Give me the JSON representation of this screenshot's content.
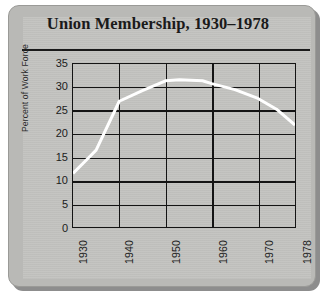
{
  "chart_data": {
    "type": "line",
    "title": "Union Membership, 1930–1978",
    "xlabel": "",
    "ylabel": "Percent of Work Force",
    "xlim": [
      1930,
      1978
    ],
    "ylim": [
      0,
      35
    ],
    "grid": true,
    "legend": "none",
    "line_color": "#ffffff",
    "x": [
      1930,
      1933,
      1935,
      1940,
      1945,
      1950,
      1953,
      1958,
      1960,
      1965,
      1970,
      1974,
      1978
    ],
    "values": [
      11.5,
      14.5,
      16.5,
      27.0,
      29.3,
      31.4,
      31.6,
      31.4,
      30.8,
      29.5,
      27.6,
      25.3,
      21.9
    ],
    "series": [
      {
        "name": "Union membership",
        "values": [
          11.5,
          14.5,
          16.5,
          27.0,
          29.3,
          31.4,
          31.6,
          31.4,
          30.8,
          29.5,
          27.6,
          25.3,
          21.9
        ]
      }
    ],
    "ytick_labels": [
      "35",
      "30",
      "25",
      "20",
      "15",
      "10",
      "5",
      "0"
    ],
    "ytick_values": [
      35,
      30,
      25,
      20,
      15,
      10,
      5,
      0
    ],
    "xtick_labels": [
      "1930",
      "1940",
      "1950",
      "1960",
      "1970",
      "1978"
    ],
    "xtick_values": [
      1930,
      1940,
      1950,
      1960,
      1970,
      1978
    ]
  },
  "colors": {
    "card_background": "#c3c3c0",
    "card_border": "#b9b9b6",
    "axis": "#141414",
    "line": "#ffffff",
    "text": "#1a1a1a"
  }
}
